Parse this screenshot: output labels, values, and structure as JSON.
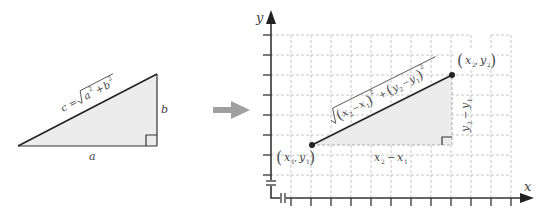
{
  "left_triangle": {
    "hypotenuse_label": "c = √(a² + b²)",
    "hyp_c": "c",
    "hyp_eq": "=",
    "hyp_a": "a",
    "hyp_plus": "+",
    "hyp_b": "b",
    "hyp_exp": "2",
    "side_a_label": "a",
    "side_b_label": "b",
    "fill_color": "#ececec"
  },
  "arrow": {
    "color": "#a0a0a0",
    "direction": "right"
  },
  "coordinate_plane": {
    "x_axis_label": "x",
    "y_axis_label": "y",
    "point1": {
      "x": "x",
      "y": "y",
      "sub": "1",
      "label": "(x₁, y₁)"
    },
    "point2": {
      "x": "x",
      "y": "y",
      "sub": "2",
      "label": "(x₂, y₂)"
    },
    "horizontal_leg_label": "x₂ − x₁",
    "vertical_leg_label": "y₂ − y₁",
    "distance_label": "√((x₂ − x₁)² + (y₂ − y₁)²)",
    "dist": {
      "x": "x",
      "y": "y",
      "s2": "2",
      "s1": "1",
      "minus": "−",
      "plus": "+",
      "exp": "2"
    },
    "leg_h": {
      "x": "x",
      "minus": "−",
      "s2": "2",
      "s1": "1"
    },
    "leg_v": {
      "y": "y",
      "minus": "−",
      "s2": "2",
      "s1": "1"
    },
    "grid": true,
    "axis_breaks": true
  }
}
